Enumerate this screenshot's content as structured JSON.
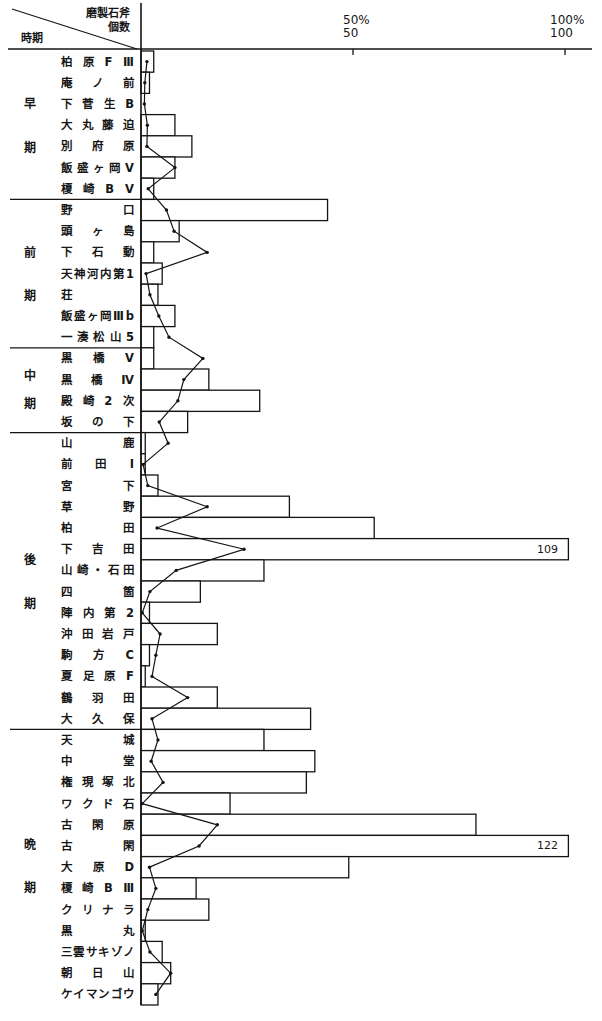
{
  "header": {
    "count_title_line1": "磨製石斧",
    "count_title_line2": "個数",
    "period_title": "時期"
  },
  "axis": {
    "ticks": [
      {
        "percent_label": "50%",
        "value_label": "50",
        "value": 50
      },
      {
        "percent_label": "100%",
        "value_label": "100",
        "value": 100
      }
    ]
  },
  "chart_data": {
    "type": "bar",
    "orientation": "horizontal",
    "title": "",
    "xlabel": "磨製石斧 個数 / %",
    "ylabel": "時期",
    "xlim": [
      0,
      100
    ],
    "xticks": [
      50,
      100
    ],
    "grid": false,
    "legend": null,
    "periods": [
      {
        "name": "早期",
        "chars": [
          "早",
          "期"
        ],
        "start": 0,
        "count": 7
      },
      {
        "name": "前期",
        "chars": [
          "前",
          "期"
        ],
        "start": 7,
        "count": 7
      },
      {
        "name": "中期",
        "chars": [
          "中",
          "期"
        ],
        "start": 14,
        "count": 4
      },
      {
        "name": "後期",
        "chars": [
          "後",
          "期"
        ],
        "start": 18,
        "count": 14
      },
      {
        "name": "晩期",
        "chars": [
          "晩",
          "期"
        ],
        "start": 32,
        "count": 13
      }
    ],
    "categories": [
      "柏原FⅢ",
      "庵ノ前",
      "下菅生B",
      "大丸藤迫",
      "別府原",
      "飯盛ヶ岡V",
      "榎崎BV",
      "野口",
      "頭ヶ島",
      "下石動",
      "天神河内第1",
      "荘",
      "飯盛ヶ岡Ⅲb",
      "一湊松山5",
      "黒橋V",
      "黒橋Ⅳ",
      "殿崎2次",
      "坂の下",
      "山鹿",
      "前田Ⅰ",
      "宮下",
      "草野",
      "柏田",
      "下吉田",
      "山崎・石田",
      "四箇",
      "陣内第2",
      "沖田岩戸",
      "駒方C",
      "夏足原F",
      "鶴羽田",
      "大久保",
      "天城",
      "中堂",
      "権現塚北",
      "ワクド石",
      "古閑原",
      "古閑",
      "大原D",
      "榎崎BⅢ",
      "クリナラ",
      "黒丸",
      "三雲サキゾノ",
      "朝日山",
      "ケイマンゴウ"
    ],
    "series": [
      {
        "name": "個数",
        "type": "bar",
        "values": [
          3,
          2,
          0,
          8,
          12,
          8,
          3,
          44,
          9,
          3,
          5,
          4,
          8,
          3,
          3,
          16,
          28,
          11,
          1,
          1,
          4,
          35,
          55,
          109,
          29,
          14,
          2,
          18,
          2,
          1,
          18,
          40,
          29,
          41,
          39,
          21,
          79,
          122,
          49,
          13,
          16,
          1,
          5,
          7,
          4
        ]
      },
      {
        "name": "%",
        "type": "line",
        "values": [
          1.4,
          0.9,
          0.8,
          1.5,
          1.4,
          8.0,
          1.7,
          6.0,
          7.8,
          15.6,
          1.2,
          2.1,
          4.2,
          6.6,
          14.6,
          10.1,
          8.7,
          4.3,
          6.4,
          0.5,
          1.6,
          15.6,
          3.8,
          24.3,
          8.3,
          2.1,
          0.3,
          4.5,
          3.5,
          2.6,
          11.0,
          2.6,
          4.0,
          2.4,
          5.2,
          0.3,
          18.0,
          13.7,
          2.0,
          3.5,
          1.6,
          0.3,
          2.1,
          7.0,
          3.5
        ]
      }
    ],
    "annotations": [
      {
        "category": "下吉田",
        "text": "109"
      },
      {
        "category": "古閑",
        "text": "122"
      }
    ]
  }
}
